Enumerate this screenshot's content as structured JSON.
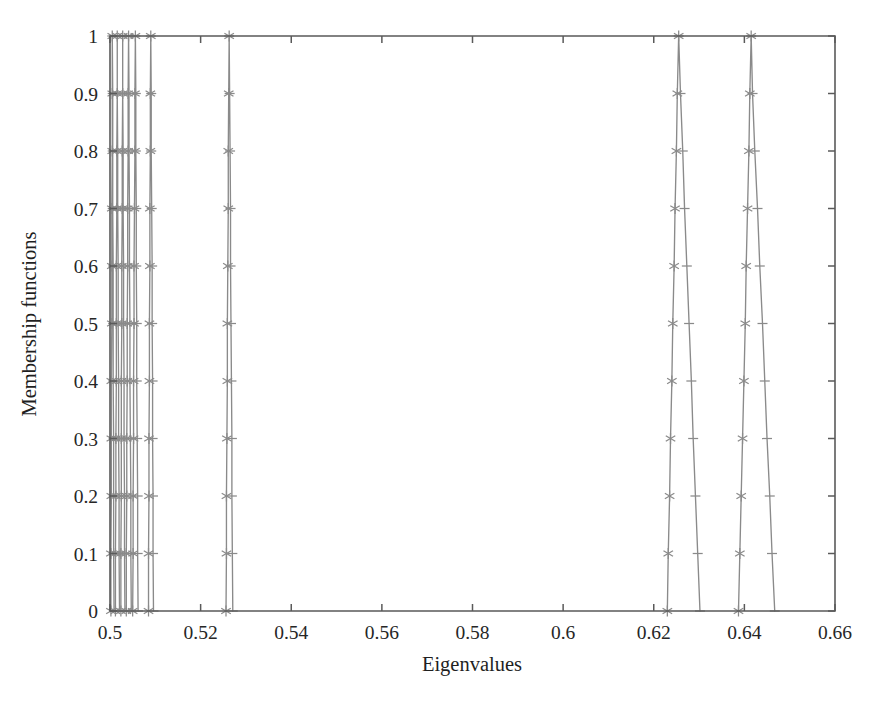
{
  "chart_data": {
    "type": "line",
    "title": "",
    "subtitle": "",
    "xlabel": "Eigenvalues",
    "ylabel": "Membership functions",
    "xlim": [
      0.5,
      0.66
    ],
    "ylim": [
      0,
      1
    ],
    "grid": false,
    "legend": null,
    "legend_position": "none",
    "x_ticks": [
      0.5,
      0.52,
      0.54,
      0.56,
      0.58,
      0.6,
      0.62,
      0.64,
      0.66
    ],
    "x_tick_labels": [
      "0.5",
      "0.52",
      "0.54",
      "0.56",
      "0.58",
      "0.6",
      "0.62",
      "0.64",
      "0.66"
    ],
    "y_ticks": [
      0,
      0.1,
      0.2,
      0.3,
      0.4,
      0.5,
      0.6,
      0.7,
      0.8,
      0.9,
      1
    ],
    "y_tick_labels": [
      "0",
      "0.1",
      "0.2",
      "0.3",
      "0.4",
      "0.5",
      "0.6",
      "0.7",
      "0.8",
      "0.9",
      "1"
    ],
    "marker": "asterisk",
    "line_color": "#8a8a8a",
    "frame_color": "#5a5a5a",
    "background_color": "#ffffff",
    "y_values": [
      0,
      0.1,
      0.2,
      0.3,
      0.4,
      0.5,
      0.6,
      0.7,
      0.8,
      0.9,
      1
    ],
    "series": [
      {
        "name": "MF1",
        "peak": 0.5005,
        "left": [
          0.5002,
          0.5002,
          0.5003,
          0.5003,
          0.5003,
          0.5004,
          0.5004,
          0.5004,
          0.5005,
          0.5005,
          0.5005
        ],
        "right": [
          0.5009,
          0.5008,
          0.5008,
          0.5008,
          0.5007,
          0.5007,
          0.5007,
          0.5006,
          0.5006,
          0.5006,
          0.5005
        ]
      },
      {
        "name": "MF2",
        "peak": 0.5016,
        "left": [
          0.5012,
          0.5012,
          0.5013,
          0.5013,
          0.5014,
          0.5014,
          0.5014,
          0.5015,
          0.5015,
          0.5016,
          0.5016
        ],
        "right": [
          0.5021,
          0.502,
          0.502,
          0.5019,
          0.5019,
          0.5018,
          0.5018,
          0.5017,
          0.5017,
          0.5016,
          0.5016
        ]
      },
      {
        "name": "MF3",
        "peak": 0.5028,
        "left": [
          0.5024,
          0.5024,
          0.5025,
          0.5025,
          0.5025,
          0.5026,
          0.5026,
          0.5027,
          0.5027,
          0.5028,
          0.5028
        ],
        "right": [
          0.5033,
          0.5032,
          0.5032,
          0.5031,
          0.5031,
          0.503,
          0.503,
          0.5029,
          0.5029,
          0.5028,
          0.5028
        ]
      },
      {
        "name": "MF4",
        "peak": 0.5041,
        "left": [
          0.5036,
          0.5036,
          0.5037,
          0.5037,
          0.5038,
          0.5038,
          0.5039,
          0.5039,
          0.504,
          0.504,
          0.5041
        ],
        "right": [
          0.5047,
          0.5046,
          0.5046,
          0.5045,
          0.5044,
          0.5044,
          0.5043,
          0.5043,
          0.5042,
          0.5042,
          0.5041
        ]
      },
      {
        "name": "MF5",
        "peak": 0.5056,
        "left": [
          0.505,
          0.5051,
          0.5051,
          0.5052,
          0.5052,
          0.5053,
          0.5053,
          0.5054,
          0.5055,
          0.5055,
          0.5056
        ],
        "right": [
          0.5062,
          0.5061,
          0.5061,
          0.506,
          0.5059,
          0.5059,
          0.5058,
          0.5058,
          0.5057,
          0.5057,
          0.5056
        ]
      },
      {
        "name": "MF6",
        "peak": 0.509,
        "left": [
          0.5085,
          0.5085,
          0.5086,
          0.5086,
          0.5087,
          0.5087,
          0.5088,
          0.5088,
          0.5089,
          0.5089,
          0.509
        ],
        "right": [
          0.5096,
          0.5095,
          0.5095,
          0.5094,
          0.5094,
          0.5093,
          0.5093,
          0.5092,
          0.5091,
          0.5091,
          0.509
        ]
      },
      {
        "name": "MF7",
        "peak": 0.5263,
        "left": [
          0.5256,
          0.5257,
          0.5257,
          0.5258,
          0.5259,
          0.5259,
          0.526,
          0.5261,
          0.5261,
          0.5262,
          0.5263
        ],
        "right": [
          0.5271,
          0.527,
          0.5269,
          0.5269,
          0.5268,
          0.5267,
          0.5266,
          0.5266,
          0.5265,
          0.5264,
          0.5263
        ]
      },
      {
        "name": "MF8",
        "peak": 0.6255,
        "left": [
          0.623,
          0.6232,
          0.6235,
          0.6237,
          0.624,
          0.6242,
          0.6245,
          0.6247,
          0.625,
          0.6252,
          0.6255
        ],
        "right": [
          0.6302,
          0.6297,
          0.6292,
          0.6287,
          0.6283,
          0.6278,
          0.6273,
          0.6268,
          0.6264,
          0.6259,
          0.6255
        ]
      },
      {
        "name": "MF9",
        "peak": 0.6415,
        "left": [
          0.6387,
          0.639,
          0.6393,
          0.6396,
          0.6399,
          0.6402,
          0.6404,
          0.6407,
          0.641,
          0.6412,
          0.6415
        ],
        "right": [
          0.6467,
          0.6461,
          0.6456,
          0.645,
          0.6445,
          0.644,
          0.6434,
          0.6429,
          0.6423,
          0.6418,
          0.6415
        ]
      }
    ]
  }
}
